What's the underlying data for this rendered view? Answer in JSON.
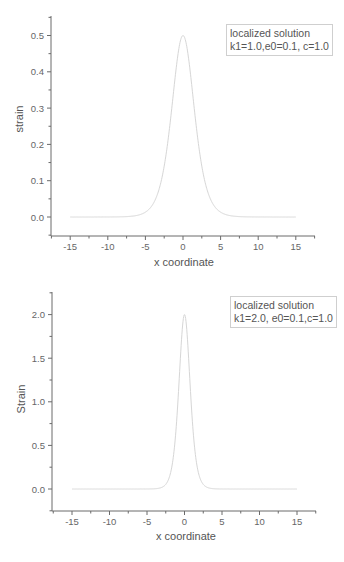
{
  "chart_data": [
    {
      "type": "line",
      "title": "",
      "xlabel": "x coordinate",
      "ylabel": "strain",
      "legend": [
        "localized solution",
        "k1=1.0,e0=0.1, c=1.0"
      ],
      "legend_position": "top-right",
      "grid": false,
      "xlim": [
        -17.5,
        17.5
      ],
      "ylim": [
        -0.05,
        0.55
      ],
      "xticks": [
        -15,
        -10,
        -5,
        0,
        5,
        10,
        15
      ],
      "xtick_labels": [
        "-15",
        "-10",
        "-5",
        "0",
        "5",
        "10",
        "15"
      ],
      "yticks": [
        0.0,
        0.1,
        0.2,
        0.3,
        0.4,
        0.5
      ],
      "ytick_labels": [
        "0.0",
        "0.1",
        "0.2",
        "0.3",
        "0.4",
        "0.5"
      ],
      "line_color": "#d6d6d6",
      "model": {
        "form": "A*sech^2(k*x)",
        "A": 0.5,
        "k": 0.5
      },
      "x": [
        -15,
        -10,
        -7.5,
        -5,
        -4,
        -3,
        -2,
        -1.5,
        -1,
        -0.5,
        0,
        0.5,
        1,
        1.5,
        2,
        3,
        4,
        5,
        7.5,
        10,
        15
      ],
      "values": [
        0.0,
        0.0001,
        0.0011,
        0.0132,
        0.0353,
        0.088,
        0.21,
        0.2827,
        0.3932,
        0.4697,
        0.5,
        0.4697,
        0.3932,
        0.2827,
        0.21,
        0.088,
        0.0353,
        0.0132,
        0.0011,
        0.0001,
        0.0
      ]
    },
    {
      "type": "line",
      "title": "",
      "xlabel": "x coordinate",
      "ylabel": "Strain",
      "legend": [
        "localized solution",
        "k1=2.0, e0=0.1,c=1.0"
      ],
      "legend_position": "top-right",
      "grid": false,
      "xlim": [
        -17.5,
        17.5
      ],
      "ylim": [
        -0.25,
        2.25
      ],
      "xticks": [
        -15,
        -10,
        -5,
        0,
        5,
        10,
        15
      ],
      "xtick_labels": [
        "-15",
        "-10",
        "-5",
        "0",
        "5",
        "10",
        "15"
      ],
      "yticks": [
        0.0,
        0.5,
        1.0,
        1.5,
        2.0
      ],
      "ytick_labels": [
        "0.0",
        "0.5",
        "1.0",
        "1.5",
        "2.0"
      ],
      "line_color": "#d6d6d6",
      "model": {
        "form": "A*sech^2(k*x)",
        "A": 2.0,
        "k": 1.0
      },
      "x": [
        -15,
        -10,
        -5,
        -4,
        -3,
        -2,
        -1.5,
        -1,
        -0.5,
        0,
        0.5,
        1,
        1.5,
        2,
        3,
        4,
        5,
        10,
        15
      ],
      "values": [
        0.0,
        0.0,
        0.0004,
        0.0027,
        0.0197,
        0.1413,
        0.3603,
        0.8399,
        1.5729,
        2.0,
        1.5729,
        0.8399,
        0.3603,
        0.1413,
        0.0197,
        0.0027,
        0.0004,
        0.0,
        0.0
      ]
    }
  ],
  "charts": [
    {
      "ylabel": "strain",
      "xlabel": "x coordinate",
      "legend_line1": "localized solution",
      "legend_line2": "k1=1.0,e0=0.1, c=1.0"
    },
    {
      "ylabel": "Strain",
      "xlabel": "x coordinate",
      "legend_line1": "localized solution",
      "legend_line2": "k1=2.0, e0=0.1,c=1.0"
    }
  ],
  "colors": {
    "axis": "#6a6a6a",
    "curve": "#d6d6d6",
    "legend_border": "#cfcfcf",
    "text": "#555555"
  }
}
